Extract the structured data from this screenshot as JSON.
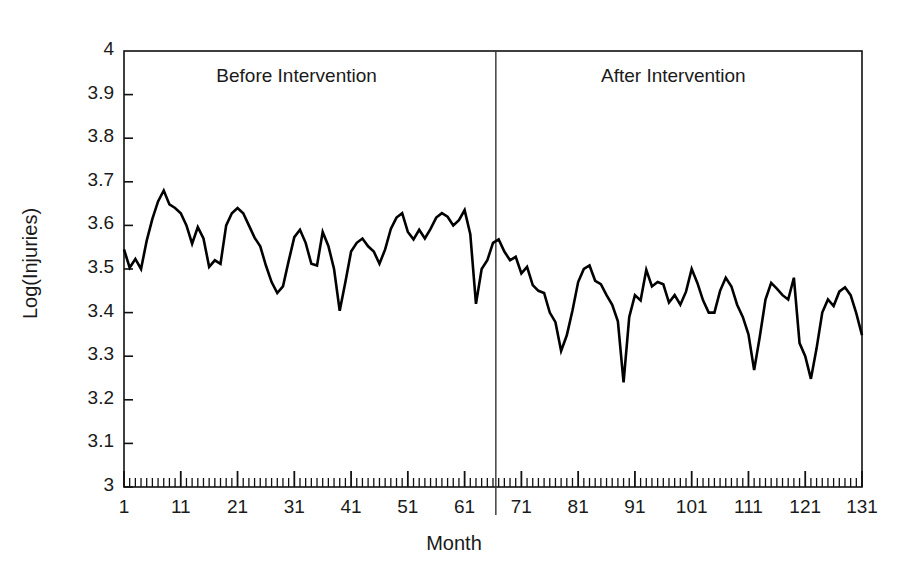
{
  "chart_data": {
    "type": "line",
    "title": "",
    "xlabel": "Month",
    "ylabel": "Log(Injuries)",
    "xlim": [
      1,
      131
    ],
    "ylim": [
      3,
      4
    ],
    "grid": false,
    "legend_position": "none",
    "y_ticks": [
      "4",
      "3.9",
      "3.8",
      "3.7",
      "3.6",
      "3.5",
      "3.4",
      "3.3",
      "3.2",
      "3.1",
      "3"
    ],
    "y_tick_values": [
      4,
      3.9,
      3.8,
      3.7,
      3.6,
      3.5,
      3.4,
      3.3,
      3.2,
      3.1,
      3
    ],
    "x_ticks": [
      "1",
      "11",
      "21",
      "31",
      "41",
      "51",
      "61",
      "71",
      "81",
      "91",
      "101",
      "111",
      "121",
      "131"
    ],
    "x_tick_values": [
      1,
      11,
      21,
      31,
      41,
      51,
      61,
      71,
      81,
      91,
      101,
      111,
      121,
      131
    ],
    "x_minor_tick_interval": 1,
    "annotations": [
      {
        "name": "before-intervention-label",
        "text": "Before Intervention",
        "x": 34,
        "y": 3.94
      },
      {
        "name": "after-intervention-label",
        "text": "After Intervention",
        "x": 100,
        "y": 3.94
      }
    ],
    "vertical_reference_line": {
      "name": "intervention-line",
      "x": 66.5,
      "label": "Intervention"
    },
    "series": [
      {
        "name": "Log(Injuries)",
        "color": "#000000",
        "x": [
          1,
          2,
          3,
          4,
          5,
          6,
          7,
          8,
          9,
          10,
          11,
          12,
          13,
          14,
          15,
          16,
          17,
          18,
          19,
          20,
          21,
          22,
          23,
          24,
          25,
          26,
          27,
          28,
          29,
          30,
          31,
          32,
          33,
          34,
          35,
          36,
          37,
          38,
          39,
          40,
          41,
          42,
          43,
          44,
          45,
          46,
          47,
          48,
          49,
          50,
          51,
          52,
          53,
          54,
          55,
          56,
          57,
          58,
          59,
          60,
          61,
          62,
          63,
          64,
          65,
          66,
          67,
          68,
          69,
          70,
          71,
          72,
          73,
          74,
          75,
          76,
          77,
          78,
          79,
          80,
          81,
          82,
          83,
          84,
          85,
          86,
          87,
          88,
          89,
          90,
          91,
          92,
          93,
          94,
          95,
          96,
          97,
          98,
          99,
          100,
          101,
          102,
          103,
          104,
          105,
          106,
          107,
          108,
          109,
          110,
          111,
          112,
          113,
          114,
          115,
          116,
          117,
          118,
          119,
          120,
          121,
          122,
          123,
          124,
          125,
          126,
          127,
          128,
          129,
          130,
          131
        ],
        "values": [
          3.545,
          3.503,
          3.523,
          3.5,
          3.565,
          3.615,
          3.655,
          3.68,
          3.648,
          3.64,
          3.628,
          3.6,
          3.558,
          3.596,
          3.57,
          3.505,
          3.52,
          3.512,
          3.6,
          3.628,
          3.64,
          3.628,
          3.6,
          3.572,
          3.552,
          3.508,
          3.47,
          3.445,
          3.46,
          3.518,
          3.573,
          3.59,
          3.56,
          3.512,
          3.508,
          3.585,
          3.553,
          3.5,
          3.404,
          3.47,
          3.54,
          3.56,
          3.57,
          3.552,
          3.54,
          3.512,
          3.545,
          3.592,
          3.618,
          3.628,
          3.585,
          3.568,
          3.59,
          3.57,
          3.592,
          3.618,
          3.628,
          3.62,
          3.6,
          3.612,
          3.635,
          3.58,
          3.42,
          3.5,
          3.52,
          3.56,
          3.568,
          3.54,
          3.52,
          3.528,
          3.49,
          3.505,
          3.463,
          3.45,
          3.445,
          3.4,
          3.378,
          3.312,
          3.348,
          3.405,
          3.47,
          3.5,
          3.508,
          3.473,
          3.465,
          3.44,
          3.418,
          3.38,
          3.24,
          3.39,
          3.44,
          3.428,
          3.498,
          3.46,
          3.47,
          3.465,
          3.423,
          3.44,
          3.418,
          3.448,
          3.5,
          3.468,
          3.428,
          3.4,
          3.4,
          3.45,
          3.48,
          3.46,
          3.418,
          3.39,
          3.35,
          3.268,
          3.345,
          3.43,
          3.468,
          3.455,
          3.44,
          3.43,
          3.48,
          3.33,
          3.3,
          3.248,
          3.318,
          3.4,
          3.43,
          3.415,
          3.448,
          3.458,
          3.44,
          3.398,
          3.348
        ]
      }
    ]
  },
  "axis_title_x": "Month",
  "axis_title_y": "Log(Injuries)"
}
